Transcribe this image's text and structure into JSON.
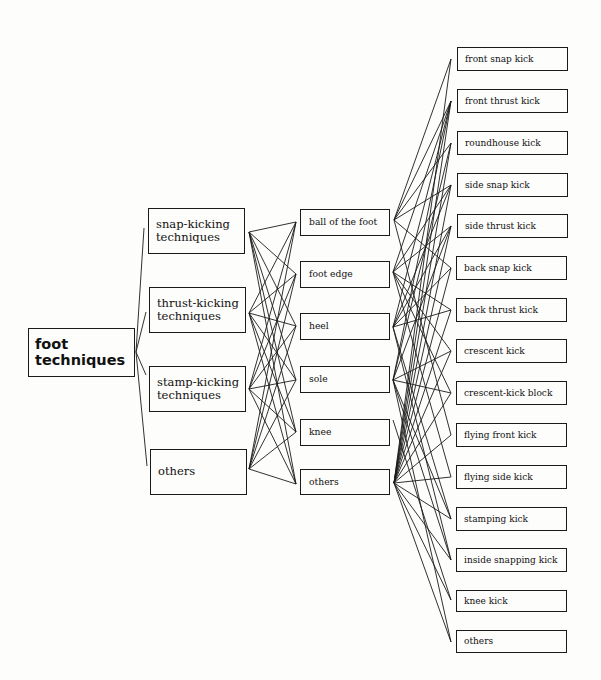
{
  "diagram": {
    "title": "foot techniques",
    "root": {
      "label": "foot\ntechniques",
      "box": [
        28,
        328,
        107,
        49
      ],
      "anchor_right": [
        136,
        352
      ]
    },
    "categories": [
      {
        "label": "snap-kicking\ntechniques",
        "box": [
          148,
          208,
          97,
          46
        ],
        "anchor_left": [
          144,
          228
        ],
        "anchor_right": [
          249,
          232
        ]
      },
      {
        "label": "thrust-kicking\ntechniques",
        "box": [
          149,
          287,
          97,
          46
        ],
        "anchor_left": [
          146,
          312
        ],
        "anchor_right": [
          249,
          313
        ]
      },
      {
        "label": "stamp-kicking\ntechniques",
        "box": [
          149,
          366,
          97,
          46
        ],
        "anchor_left": [
          146,
          375
        ],
        "anchor_right": [
          249,
          389
        ]
      },
      {
        "label": "others",
        "box": [
          150,
          449,
          97,
          46
        ],
        "anchor_left": [
          147,
          466
        ],
        "anchor_right": [
          249,
          469
        ]
      }
    ],
    "body_parts": [
      {
        "label": "ball of the foot",
        "box": [
          300,
          209,
          90,
          27
        ],
        "anchor_left": [
          296,
          222
        ],
        "anchor_right": [
          394,
          220
        ]
      },
      {
        "label": "foot edge",
        "box": [
          300,
          261,
          90,
          27
        ],
        "anchor_left": [
          296,
          274
        ],
        "anchor_right": [
          393,
          272
        ]
      },
      {
        "label": "heel",
        "box": [
          300,
          313,
          90,
          27
        ],
        "anchor_left": [
          296,
          326
        ],
        "anchor_right": [
          393,
          327
        ]
      },
      {
        "label": "sole",
        "box": [
          300,
          366,
          90,
          27
        ],
        "anchor_left": [
          296,
          380
        ],
        "anchor_right": [
          393,
          380
        ]
      },
      {
        "label": "knee",
        "box": [
          300,
          419,
          90,
          27
        ],
        "anchor_left": [
          296,
          432
        ],
        "anchor_right": [
          393,
          420
        ]
      },
      {
        "label": "others",
        "box": [
          300,
          469,
          90,
          26
        ],
        "anchor_left": [
          296,
          484
        ],
        "anchor_right": [
          394,
          483
        ]
      }
    ],
    "kicks": [
      {
        "label": "front snap kick",
        "box": [
          457,
          47,
          111,
          24
        ],
        "anchor_left": [
          451,
          59
        ]
      },
      {
        "label": "front thrust kick",
        "box": [
          457,
          89,
          111,
          24
        ],
        "anchor_left": [
          451,
          101
        ]
      },
      {
        "label": "roundhouse kick",
        "box": [
          457,
          131,
          111,
          24
        ],
        "anchor_left": [
          451,
          143
        ]
      },
      {
        "label": "side snap kick",
        "box": [
          457,
          173,
          111,
          24
        ],
        "anchor_left": [
          451,
          185
        ]
      },
      {
        "label": "side thrust kick",
        "box": [
          457,
          214,
          111,
          24
        ],
        "anchor_left": [
          451,
          226
        ]
      },
      {
        "label": "back snap kick",
        "box": [
          456,
          256,
          111,
          24
        ],
        "anchor_left": [
          451,
          268
        ]
      },
      {
        "label": "back thrust kick",
        "box": [
          456,
          298,
          111,
          24
        ],
        "anchor_left": [
          451,
          310
        ]
      },
      {
        "label": "crescent kick",
        "box": [
          456,
          339,
          111,
          24
        ],
        "anchor_left": [
          451,
          351
        ]
      },
      {
        "label": "crescent-kick block",
        "box": [
          456,
          381,
          111,
          24
        ],
        "anchor_left": [
          451,
          393
        ]
      },
      {
        "label": "flying front kick",
        "box": [
          456,
          423,
          111,
          24
        ],
        "anchor_left": [
          451,
          435
        ]
      },
      {
        "label": "flying side kick",
        "box": [
          456,
          465,
          111,
          24
        ],
        "anchor_left": [
          451,
          477
        ]
      },
      {
        "label": "stamping kick",
        "box": [
          456,
          507,
          111,
          24
        ],
        "anchor_left": [
          451,
          519
        ]
      },
      {
        "label": "inside snapping kick",
        "box": [
          456,
          548,
          111,
          24
        ],
        "anchor_left": [
          451,
          560
        ]
      },
      {
        "label": "knee kick",
        "box": [
          456,
          590,
          111,
          22
        ],
        "anchor_left": [
          451,
          600
        ]
      },
      {
        "label": "others",
        "box": [
          456,
          630,
          111,
          23
        ],
        "anchor_left": [
          451,
          642
        ]
      }
    ],
    "links": {
      "root_to_categories": [
        0,
        1,
        2,
        3
      ],
      "categories_to_body_parts": [
        [
          0,
          1,
          2,
          3,
          4,
          5
        ],
        [
          0,
          1,
          2,
          3,
          4,
          5
        ],
        [
          0,
          1,
          2,
          3,
          4,
          5
        ],
        [
          0,
          1,
          2,
          3,
          4,
          5
        ]
      ],
      "body_parts_to_kicks": [
        [
          0,
          1,
          2,
          3,
          5,
          9
        ],
        [
          1,
          3,
          4,
          6,
          7,
          8,
          10
        ],
        [
          1,
          3,
          4,
          5,
          6,
          11,
          12
        ],
        [
          1,
          2,
          4,
          7,
          8,
          11,
          12,
          14
        ],
        [
          13
        ],
        [
          0,
          1,
          2,
          3,
          4,
          5,
          6,
          7,
          8,
          9,
          10,
          11,
          12,
          13,
          14
        ]
      ]
    },
    "colors": {
      "line": "#1a1a1a",
      "background": "#fdfdfb"
    }
  }
}
